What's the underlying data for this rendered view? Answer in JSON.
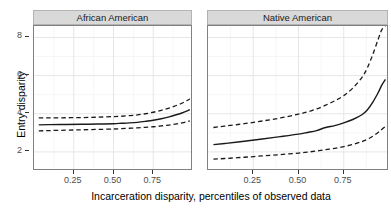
{
  "chart_data": {
    "type": "line",
    "title": "",
    "xlabel": "Incarceration disparity, percentiles of observed data",
    "ylabel": "Entry disparity",
    "xlim": [
      0.0,
      1.0
    ],
    "ylim": [
      1.0,
      8.6
    ],
    "grid": true,
    "legend": "none",
    "facets": [
      {
        "label": "African American",
        "x": [
          0.03,
          0.1,
          0.2,
          0.3,
          0.4,
          0.5,
          0.55,
          0.6,
          0.65,
          0.7,
          0.75,
          0.8,
          0.85,
          0.9,
          0.93,
          0.96,
          0.98
        ],
        "series": [
          {
            "name": "estimate",
            "style": "solid",
            "values": [
              3.42,
              3.43,
              3.44,
              3.45,
              3.46,
              3.48,
              3.5,
              3.52,
              3.55,
              3.6,
              3.66,
              3.74,
              3.84,
              3.96,
              4.04,
              4.14,
              4.22
            ]
          },
          {
            "name": "upper-bound",
            "style": "dashed",
            "values": [
              3.78,
              3.78,
              3.79,
              3.8,
              3.82,
              3.85,
              3.87,
              3.9,
              3.94,
              4.0,
              4.08,
              4.18,
              4.3,
              4.45,
              4.55,
              4.68,
              4.78
            ]
          },
          {
            "name": "lower-bound",
            "style": "dashed",
            "values": [
              3.1,
              3.12,
              3.14,
              3.16,
              3.18,
              3.2,
              3.22,
              3.24,
              3.26,
              3.29,
              3.32,
              3.36,
              3.41,
              3.47,
              3.52,
              3.58,
              3.63
            ]
          }
        ]
      },
      {
        "label": "Native American",
        "x": [
          0.03,
          0.1,
          0.2,
          0.3,
          0.4,
          0.5,
          0.55,
          0.6,
          0.65,
          0.7,
          0.75,
          0.8,
          0.85,
          0.88,
          0.91,
          0.94,
          0.96,
          0.98
        ],
        "series": [
          {
            "name": "estimate",
            "style": "solid",
            "values": [
              2.38,
              2.45,
              2.56,
              2.68,
              2.8,
              2.93,
              3.02,
              3.12,
              3.28,
              3.38,
              3.52,
              3.7,
              3.95,
              4.2,
              4.6,
              5.1,
              5.5,
              5.8
            ]
          },
          {
            "name": "upper-bound",
            "style": "dashed",
            "values": [
              3.28,
              3.36,
              3.48,
              3.62,
              3.78,
              3.98,
              4.1,
              4.25,
              4.45,
              4.68,
              4.95,
              5.35,
              5.9,
              6.4,
              7.1,
              7.9,
              8.4,
              8.6
            ]
          },
          {
            "name": "lower-bound",
            "style": "dashed",
            "values": [
              1.62,
              1.66,
              1.72,
              1.79,
              1.86,
              1.94,
              1.99,
              2.05,
              2.12,
              2.19,
              2.28,
              2.39,
              2.54,
              2.66,
              2.82,
              3.02,
              3.18,
              3.34
            ]
          }
        ]
      }
    ],
    "y_ticks": [
      {
        "value": 2,
        "label": "2"
      },
      {
        "value": 4,
        "label": "4"
      },
      {
        "value": 6,
        "label": "6"
      },
      {
        "value": 8,
        "label": "8"
      }
    ],
    "x_ticks": [
      {
        "value": 0.25,
        "label": "0.25"
      },
      {
        "value": 0.5,
        "label": "0.50"
      },
      {
        "value": 0.75,
        "label": "0.75"
      }
    ],
    "x_minor_gridlines": [
      0.125,
      0.375,
      0.625,
      0.875
    ],
    "y_minor_gridlines": [
      3,
      5,
      7
    ],
    "colors": {
      "line": "#1a1a1a",
      "panel_background": "#ffffff",
      "panel_border": "#808080",
      "strip_background": "#d9d9d9",
      "major_grid": "#e6e6e6",
      "minor_grid": "#f2f2f2",
      "tick_label": "#4d4d4d",
      "axis_title": "#000000"
    }
  }
}
